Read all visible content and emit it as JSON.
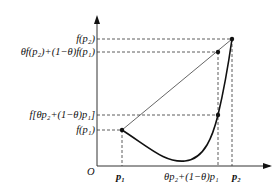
{
  "labels": {
    "y_fp2": "f(p₂)",
    "y_chord": "θf(p₂)+(1−θ)f(p₁)",
    "y_fmix": "f[θp₂+(1−θ)p₁]",
    "y_fp1": "f(p₁)",
    "origin": "O",
    "x_p1": "p₁",
    "x_mix": "θp₂+(1−θ)p₁",
    "x_p2": "p₂"
  },
  "colors": {
    "curve": "#111111",
    "chord": "#555555",
    "axis": "#333333"
  }
}
